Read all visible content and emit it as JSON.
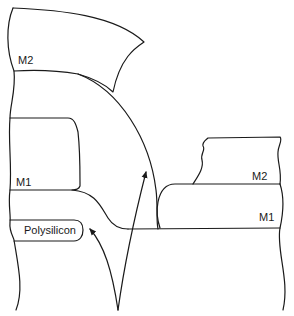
{
  "diagram": {
    "type": "cross-section",
    "labels": {
      "m2_left": "M2",
      "m1_left": "M1",
      "polysilicon": "Polysilicon",
      "m2_right": "M2",
      "m1_right": "M1"
    },
    "colors": {
      "line": "#1a1a1a",
      "background": "#ffffff"
    },
    "arrows": [
      {
        "from": "bottom-center",
        "to": "m2-step-sidewall"
      },
      {
        "from": "bottom-center",
        "to": "polysilicon-edge"
      }
    ]
  }
}
